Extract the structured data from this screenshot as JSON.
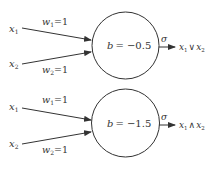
{
  "diagrams": [
    {
      "name": "or-perceptron",
      "inputs": [
        {
          "label": "x",
          "sub": "1",
          "weight_label": "w",
          "weight_sub": "1",
          "weight_value": "=1"
        },
        {
          "label": "x",
          "sub": "2",
          "weight_label": "w",
          "weight_sub": "2",
          "weight_value": "=1"
        }
      ],
      "bias_label": "b",
      "bias_value": "= −0.5",
      "activation": "σ",
      "output": {
        "a": "x",
        "a_sub": "1",
        "op": "∨",
        "b": "x",
        "b_sub": "2"
      }
    },
    {
      "name": "and-perceptron",
      "inputs": [
        {
          "label": "x",
          "sub": "1",
          "weight_label": "w",
          "weight_sub": "1",
          "weight_value": "=1"
        },
        {
          "label": "x",
          "sub": "2",
          "weight_label": "w",
          "weight_sub": "2",
          "weight_value": "=1"
        }
      ],
      "bias_label": "b",
      "bias_value": "= −1.5",
      "activation": "σ",
      "output": {
        "a": "x",
        "a_sub": "1",
        "op": "∧",
        "b": "x",
        "b_sub": "2"
      }
    }
  ],
  "colors": {
    "stroke": "#333333",
    "background": "#ffffff"
  }
}
